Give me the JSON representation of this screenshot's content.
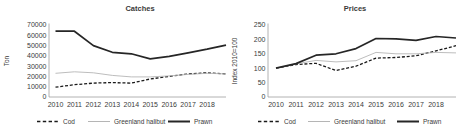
{
  "colors": {
    "cod": "#1a1a1a",
    "halibut": "#b5b5b5",
    "prawn": "#262626",
    "axis": "#9e9e9e",
    "text": "#3a3a3a",
    "background": "#ffffff"
  },
  "chart_data": [
    {
      "type": "line",
      "title": "Catches",
      "ylabel": "Ton",
      "xlabel": "",
      "grid": false,
      "legend_position": "bottom",
      "ylim": [
        0,
        70000
      ],
      "yticks": [
        "0",
        "10000",
        "20000",
        "30000",
        "40000",
        "50000",
        "60000",
        "70000"
      ],
      "categories": [
        "2010",
        "2011",
        "2012",
        "2013",
        "2014",
        "2015",
        "2016",
        "2017",
        "2018",
        ""
      ],
      "series": [
        {
          "name": "Cod",
          "style": "dashed",
          "values": [
            9500,
            12000,
            13500,
            14000,
            13500,
            17500,
            20000,
            22500,
            23500,
            22500
          ]
        },
        {
          "name": "Greenland halibut",
          "style": "thin",
          "values": [
            23000,
            24500,
            23500,
            21000,
            19500,
            19500,
            20500,
            22000,
            23000,
            22500
          ]
        },
        {
          "name": "Prawn",
          "style": "thick",
          "values": [
            64000,
            64000,
            50000,
            43500,
            42000,
            37000,
            39500,
            43000,
            46500,
            50500
          ]
        }
      ]
    },
    {
      "type": "line",
      "title": "Prices",
      "ylabel": "Index 2010=100",
      "xlabel": "",
      "grid": false,
      "legend_position": "bottom",
      "ylim": [
        0,
        250
      ],
      "yticks": [
        "0",
        "50",
        "100",
        "150",
        "200",
        "250"
      ],
      "categories": [
        "2010",
        "2011",
        "2012",
        "2013",
        "2014",
        "2015",
        "2016",
        "2017",
        "2018",
        ""
      ],
      "series": [
        {
          "name": "Cod",
          "style": "dashed",
          "values": [
            100,
            113,
            117,
            92,
            107,
            135,
            137,
            143,
            160,
            178
          ]
        },
        {
          "name": "Greenland halibut",
          "style": "thin",
          "values": [
            100,
            115,
            127,
            122,
            126,
            155,
            150,
            150,
            155,
            153
          ]
        },
        {
          "name": "Prawn",
          "style": "thick",
          "values": [
            100,
            116,
            145,
            150,
            168,
            203,
            202,
            197,
            210,
            205
          ]
        }
      ]
    }
  ]
}
